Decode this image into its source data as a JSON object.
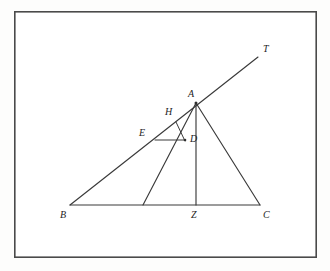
{
  "figure": {
    "background_color": "#fdfdfc",
    "frame_color": "#4a4a4a",
    "line_color": "#3a3a3a",
    "label_color": "#1d1d1d",
    "frame": {
      "x": 14,
      "y": 11,
      "width": 303,
      "height": 247
    },
    "points": [
      {
        "id": "A",
        "label": "A",
        "x": 196,
        "y": 103,
        "label_x": 188,
        "label_y": 89
      },
      {
        "id": "B",
        "label": "B",
        "x": 70,
        "y": 205,
        "label_x": 60,
        "label_y": 210
      },
      {
        "id": "C",
        "label": "C",
        "x": 260,
        "y": 205,
        "label_x": 263,
        "label_y": 210
      },
      {
        "id": "T",
        "label": "T",
        "x": 258,
        "y": 57,
        "label_x": 263,
        "label_y": 44
      },
      {
        "id": "D",
        "label": "D",
        "x": 185,
        "y": 140,
        "label_x": 190,
        "label_y": 134
      },
      {
        "id": "E",
        "label": "E",
        "x": 155,
        "y": 140,
        "label_x": 139,
        "label_y": 128
      },
      {
        "id": "H",
        "label": "H",
        "x": 176,
        "y": 122,
        "label_x": 165,
        "label_y": 107
      },
      {
        "id": "Z",
        "label": "Z",
        "x": 196,
        "y": 205,
        "label_x": 191,
        "label_y": 210
      },
      {
        "id": "M",
        "label": "",
        "x": 143,
        "y": 205,
        "label_x": 0,
        "label_y": 0
      }
    ],
    "segments": [
      {
        "name": "ray-B-to-T",
        "from": "B",
        "to": "T",
        "style": "solid"
      },
      {
        "name": "side-B-to-C",
        "from": "B",
        "to": "C",
        "style": "solid"
      },
      {
        "name": "side-A-to-C",
        "from": "A",
        "to": "C",
        "style": "solid"
      },
      {
        "name": "cevian-A-to-M",
        "from": "A",
        "to": "M",
        "style": "solid"
      },
      {
        "name": "cevian-A-to-Z",
        "from": "A",
        "to": "Z",
        "style": "solid"
      },
      {
        "name": "segment-E-to-D",
        "from": "E",
        "to": "D",
        "style": "solid"
      },
      {
        "name": "segment-H-to-D",
        "from": "H",
        "to": "D",
        "style": "solid"
      }
    ]
  }
}
